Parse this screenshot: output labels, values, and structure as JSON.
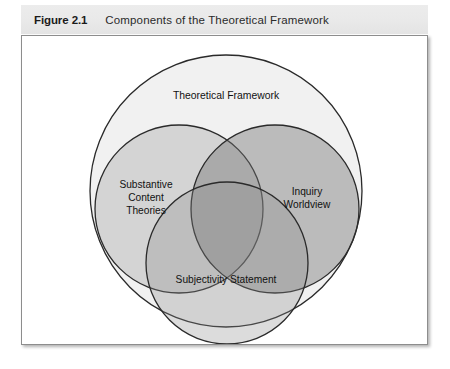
{
  "figure": {
    "number": "Figure 2.1",
    "title": "Components of the Theoretical Framework"
  },
  "diagram": {
    "type": "venn",
    "outer": {
      "label": "Theoretical Framework",
      "fill": "#f1f1f1",
      "stroke": "#2a2a2a"
    },
    "circles": [
      {
        "name": "substantive-content-theories",
        "label_lines": [
          "Substantive",
          "Content",
          "Theories"
        ],
        "fill": "#d6d6d6",
        "stroke": "#2a2a2a"
      },
      {
        "name": "inquiry-worldview",
        "label_lines": [
          "Inquiry",
          "Worldview"
        ],
        "fill": "#b0b0b0",
        "stroke": "#2a2a2a"
      },
      {
        "name": "subjectivity-statement",
        "label_lines": [
          "Subjectivity Statement"
        ],
        "fill": "#c9c9c9",
        "stroke": "#2a2a2a"
      }
    ]
  }
}
